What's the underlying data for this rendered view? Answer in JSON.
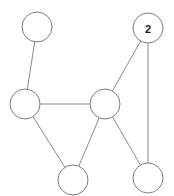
{
  "graph": {
    "background_color": "#ffffff",
    "node_fill_color": "#ffffff",
    "node_stroke_color": "#7d7d7d",
    "edge_color": "#8b8b8b",
    "label_color": "#1b1b1b",
    "node_radius": 15,
    "nodes": [
      {
        "id": "n1",
        "label": "",
        "cx": 37,
        "cy": 27,
        "r": 15
      },
      {
        "id": "n2",
        "label": "2",
        "cx": 148,
        "cy": 28,
        "r": 15
      },
      {
        "id": "n3",
        "label": "",
        "cx": 25,
        "cy": 104,
        "r": 15
      },
      {
        "id": "n4",
        "label": "",
        "cx": 105,
        "cy": 104,
        "r": 15
      },
      {
        "id": "n5",
        "label": "",
        "cx": 73,
        "cy": 180,
        "r": 15
      },
      {
        "id": "n6",
        "label": "",
        "cx": 148,
        "cy": 178,
        "r": 15
      }
    ],
    "edges": [
      {
        "id": "e1",
        "from": "n1",
        "to": "n3"
      },
      {
        "id": "e2",
        "from": "n3",
        "to": "n4"
      },
      {
        "id": "e3",
        "from": "n3",
        "to": "n5"
      },
      {
        "id": "e4",
        "from": "n4",
        "to": "n5"
      },
      {
        "id": "e5",
        "from": "n4",
        "to": "n2"
      },
      {
        "id": "e6",
        "from": "n4",
        "to": "n6"
      },
      {
        "id": "e7",
        "from": "n2",
        "to": "n6"
      }
    ]
  }
}
